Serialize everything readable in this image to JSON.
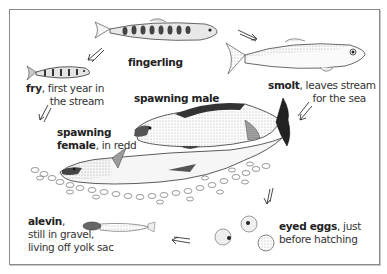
{
  "diagram": {
    "type": "life-cycle",
    "stages": [
      {
        "id": "fry",
        "name": "fry",
        "desc_line1": ", first year in",
        "desc_line2": "the stream"
      },
      {
        "id": "fingerling",
        "name": "fingerling"
      },
      {
        "id": "smolt",
        "name": "smolt",
        "desc_line1": ", leaves stream",
        "desc_line2": "for the sea"
      },
      {
        "id": "spawning-male",
        "name": "spawning male"
      },
      {
        "id": "spawning-female",
        "name_line1": "spawning",
        "name_line2": "female",
        "desc": ", in redd"
      },
      {
        "id": "eyed-eggs",
        "name": "eyed eggs",
        "desc_line1": ", just",
        "desc_line2": "before hatching"
      },
      {
        "id": "alevin",
        "name": "alevin",
        "desc_line1": ",",
        "desc_line2": "still in gravel,",
        "desc_line3": "living off yolk sac"
      }
    ],
    "cycle_order": [
      "alevin",
      "fry",
      "fingerling",
      "smolt",
      "spawning-male",
      "spawning-female",
      "eyed-eggs",
      "alevin"
    ],
    "colors": {
      "ink": "#2a2a2a",
      "frame": "#8a8a8a",
      "background": "#ffffff"
    }
  }
}
